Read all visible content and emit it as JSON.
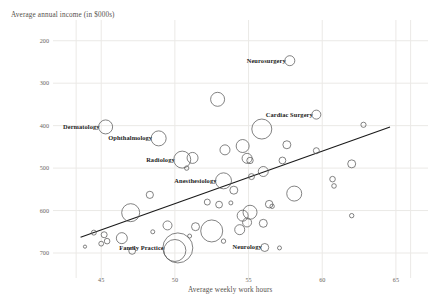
{
  "chart_data": {
    "type": "scatter",
    "title": "",
    "xlabel": "Average weekly work hours",
    "ylabel": "Average annual income (in $000s)",
    "xlim": [
      42.0,
      66.5
    ],
    "ylim": [
      160,
      730
    ],
    "xticks": [
      45,
      50,
      55,
      60,
      65
    ],
    "yticks": [
      200,
      300,
      400,
      500,
      600,
      700
    ],
    "grid": true,
    "legend": "none",
    "marker": "open-circle",
    "size_encoding": "bubble-area",
    "trendline": {
      "type": "linear",
      "x_start": 43.6,
      "y_start": 237,
      "x_end": 64.6,
      "y_end": 497
    },
    "annotations": [
      {
        "label": "Neurosurgery",
        "x": 57.8,
        "y": 653,
        "r": 5.0,
        "label_side": "left"
      },
      {
        "label": "Cardiac Surgery",
        "x": 59.6,
        "y": 526,
        "r": 4.5,
        "label_side": "left"
      },
      {
        "label": "Dermatology",
        "x": 45.3,
        "y": 497,
        "r": 7.0,
        "label_side": "left"
      },
      {
        "label": "Ophthalmology",
        "x": 48.9,
        "y": 470,
        "r": 7.5,
        "label_side": "left"
      },
      {
        "label": "Radiology",
        "x": 50.5,
        "y": 420,
        "r": 8.5,
        "label_side": "left"
      },
      {
        "label": "Anesthesiology",
        "x": 53.3,
        "y": 370,
        "r": 8.0,
        "label_side": "left"
      },
      {
        "label": "Family Practice",
        "x": 50.2,
        "y": 212,
        "r": 15.0,
        "label_side": "left"
      },
      {
        "label": "Neurology",
        "x": 56.1,
        "y": 213,
        "r": 4.0,
        "label_side": "left"
      }
    ],
    "points": [
      {
        "x": 57.8,
        "y": 653,
        "r": 5.0
      },
      {
        "x": 52.9,
        "y": 562,
        "r": 7.0
      },
      {
        "x": 59.6,
        "y": 526,
        "r": 4.5
      },
      {
        "x": 62.8,
        "y": 502,
        "r": 2.6
      },
      {
        "x": 45.3,
        "y": 497,
        "r": 7.0
      },
      {
        "x": 55.9,
        "y": 492,
        "r": 10.0
      },
      {
        "x": 48.9,
        "y": 470,
        "r": 7.5
      },
      {
        "x": 57.6,
        "y": 455,
        "r": 4.0
      },
      {
        "x": 54.6,
        "y": 452,
        "r": 6.5
      },
      {
        "x": 53.4,
        "y": 443,
        "r": 5.0
      },
      {
        "x": 59.6,
        "y": 441,
        "r": 3.0
      },
      {
        "x": 50.5,
        "y": 420,
        "r": 8.5
      },
      {
        "x": 51.2,
        "y": 424,
        "r": 5.5
      },
      {
        "x": 54.9,
        "y": 423,
        "r": 5.0
      },
      {
        "x": 55.1,
        "y": 418,
        "r": 3.2
      },
      {
        "x": 50.8,
        "y": 400,
        "r": 2.2
      },
      {
        "x": 57.3,
        "y": 418,
        "r": 3.4
      },
      {
        "x": 62.0,
        "y": 410,
        "r": 4.0
      },
      {
        "x": 53.3,
        "y": 370,
        "r": 8.0
      },
      {
        "x": 56.0,
        "y": 392,
        "r": 5.0
      },
      {
        "x": 55.2,
        "y": 380,
        "r": 3.0
      },
      {
        "x": 60.7,
        "y": 374,
        "r": 2.8
      },
      {
        "x": 60.8,
        "y": 358,
        "r": 2.3
      },
      {
        "x": 48.3,
        "y": 337,
        "r": 3.6
      },
      {
        "x": 54.0,
        "y": 348,
        "r": 4.0
      },
      {
        "x": 58.1,
        "y": 340,
        "r": 7.5
      },
      {
        "x": 52.2,
        "y": 320,
        "r": 3.0
      },
      {
        "x": 53.0,
        "y": 314,
        "r": 3.4
      },
      {
        "x": 53.8,
        "y": 318,
        "r": 2.0
      },
      {
        "x": 56.4,
        "y": 315,
        "r": 3.8
      },
      {
        "x": 56.6,
        "y": 310,
        "r": 2.2
      },
      {
        "x": 47.0,
        "y": 295,
        "r": 9.0
      },
      {
        "x": 55.1,
        "y": 296,
        "r": 7.0
      },
      {
        "x": 54.6,
        "y": 288,
        "r": 5.5
      },
      {
        "x": 54.9,
        "y": 272,
        "r": 4.5
      },
      {
        "x": 56.0,
        "y": 270,
        "r": 4.0
      },
      {
        "x": 62.0,
        "y": 288,
        "r": 2.2
      },
      {
        "x": 49.5,
        "y": 265,
        "r": 4.5
      },
      {
        "x": 51.4,
        "y": 262,
        "r": 4.0
      },
      {
        "x": 52.5,
        "y": 252,
        "r": 11.0
      },
      {
        "x": 54.4,
        "y": 255,
        "r": 5.0
      },
      {
        "x": 44.5,
        "y": 248,
        "r": 2.5
      },
      {
        "x": 45.2,
        "y": 243,
        "r": 3.0
      },
      {
        "x": 45.4,
        "y": 228,
        "r": 2.8
      },
      {
        "x": 45.0,
        "y": 222,
        "r": 2.4
      },
      {
        "x": 46.4,
        "y": 235,
        "r": 5.5
      },
      {
        "x": 50.2,
        "y": 212,
        "r": 15.0
      },
      {
        "x": 50.0,
        "y": 206,
        "r": 11.0
      },
      {
        "x": 47.1,
        "y": 205,
        "r": 3.4
      },
      {
        "x": 43.9,
        "y": 215,
        "r": 1.6
      },
      {
        "x": 53.3,
        "y": 228,
        "r": 2.2
      },
      {
        "x": 56.1,
        "y": 213,
        "r": 4.0
      },
      {
        "x": 57.1,
        "y": 212,
        "r": 2.0
      },
      {
        "x": 51.0,
        "y": 240,
        "r": 2.0
      },
      {
        "x": 48.5,
        "y": 250,
        "r": 2.0
      }
    ]
  },
  "axes": {
    "y_title": "Average annual income (in $000s)",
    "x_title": "Average weekly work hours",
    "y_ticks": [
      "700",
      "600",
      "500",
      "400",
      "300",
      "200"
    ],
    "x_ticks": [
      "45",
      "50",
      "55",
      "60",
      "65"
    ]
  },
  "colors": {
    "background": "#ffffff",
    "grid": "#ebe9e6",
    "marker_stroke": "#5a5a5a",
    "trendline": "#1a1a1a",
    "tick_text": "#6b6661",
    "title_text": "#55504c",
    "label_text": "#1c1c1c"
  }
}
